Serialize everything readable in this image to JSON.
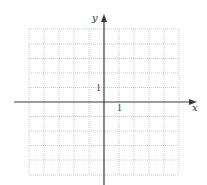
{
  "figure": {
    "type": "coordinate-grid",
    "x_axis_label": "x",
    "y_axis_label": "y",
    "x_unit_label": "1",
    "y_unit_label": "1",
    "grid_columns": 10,
    "grid_rows": 10,
    "x_range": [
      -5,
      5
    ],
    "y_range": [
      -5,
      5
    ],
    "grid_style": "dotted",
    "colors": {
      "grid": "#b8b8b8",
      "axis": "#3a3a3a",
      "background": "#ffffff"
    }
  }
}
